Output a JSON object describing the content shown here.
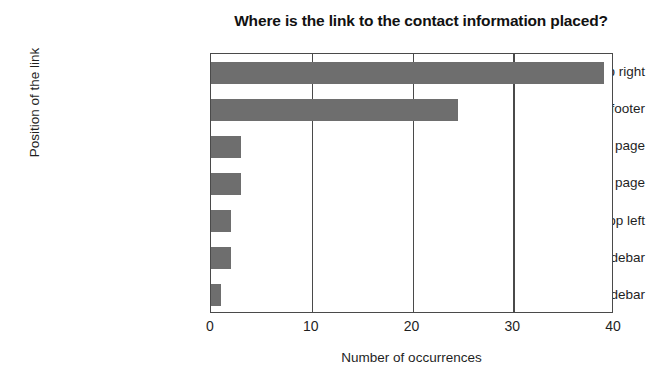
{
  "chart_data": {
    "type": "bar",
    "orientation": "horizontal",
    "title": "Where is the link to the contact information placed?",
    "xlabel": "Number of occurrences",
    "ylabel": "Position of the link",
    "categories": [
      "top right",
      "footer",
      "middle of the page",
      "no contact info page",
      "top left",
      "left sidebar",
      "right sidebar"
    ],
    "values": [
      39,
      24.5,
      3,
      3,
      2,
      2,
      1
    ],
    "xlim": [
      0,
      40
    ],
    "xticks": [
      "0",
      "10",
      "20",
      "30",
      "40"
    ],
    "xtick_values": [
      0,
      10,
      20,
      30,
      40
    ],
    "grid": "vertical",
    "legend": "none",
    "bar_color": "#6e6e6e",
    "axis_color": "#4a4a4a",
    "background": "#ffffff"
  }
}
